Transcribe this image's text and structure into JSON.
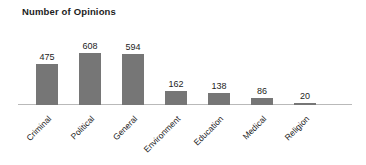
{
  "chart_data": {
    "type": "bar",
    "title": "Number of Opinions",
    "xlabel": "",
    "ylabel": "",
    "ylim": [
      0,
      608
    ],
    "grid": false,
    "legend": null,
    "orientation": "vertical",
    "bar_color": "#767676",
    "axis_color": "#b9b9b9",
    "categories": [
      "Criminal",
      "Political",
      "General",
      "Environment",
      "Education",
      "Medical",
      "Religion"
    ],
    "values": [
      475,
      608,
      594,
      162,
      138,
      86,
      20
    ],
    "data_labels": [
      "475",
      "608",
      "594",
      "162",
      "138",
      "86",
      "20"
    ],
    "tick_labels": [
      "Criminal",
      "Political",
      "General",
      "Environment",
      "Education",
      "Medical",
      "Religion"
    ],
    "tick_label_rotation": -45,
    "points": [
      {
        "category": "Criminal",
        "value": 475,
        "label": "475"
      },
      {
        "category": "Political",
        "value": 608,
        "label": "608"
      },
      {
        "category": "General",
        "value": 594,
        "label": "594"
      },
      {
        "category": "Environment",
        "value": 162,
        "label": "162"
      },
      {
        "category": "Education",
        "value": 138,
        "label": "138"
      },
      {
        "category": "Medical",
        "value": 86,
        "label": "86"
      },
      {
        "category": "Religion",
        "value": 20,
        "label": "20"
      }
    ]
  },
  "layout": {
    "bar_width_px": 22,
    "bar_pitch_px": 43,
    "first_bar_left_px": 36,
    "baseline_y_px": 105,
    "px_per_unit": 0.0855
  }
}
